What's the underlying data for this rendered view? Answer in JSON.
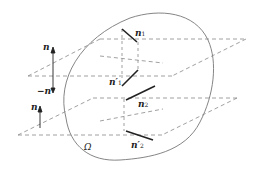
{
  "figure": {
    "region_label": "Ω",
    "labels": {
      "n_top": "n",
      "minus_n": "−n",
      "n_bottom": "n",
      "n1": "n",
      "n1_sub": "1",
      "n1_prime": "n′",
      "n1_prime_sub": "1",
      "n2": "n",
      "n2_sub": "2",
      "n2_prime": "n′",
      "n2_prime_sub": "2"
    },
    "colors": {
      "outline": "#777777",
      "dashed": "#888888",
      "vector": "#222222",
      "text": "#222222"
    }
  }
}
